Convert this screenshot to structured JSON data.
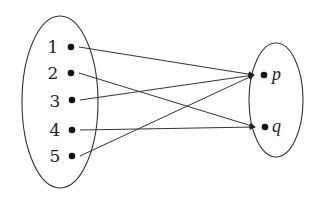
{
  "diagram": {
    "type": "mapping-diagram",
    "domain_set": {
      "elements": [
        {
          "label": "1",
          "x": 71,
          "y": 47
        },
        {
          "label": "2",
          "x": 71,
          "y": 73
        },
        {
          "label": "3",
          "x": 72,
          "y": 100
        },
        {
          "label": "4",
          "x": 72,
          "y": 130
        },
        {
          "label": "5",
          "x": 72,
          "y": 156
        }
      ]
    },
    "codomain_set": {
      "elements": [
        {
          "label": "p",
          "x": 264,
          "y": 75
        },
        {
          "label": "q",
          "x": 265,
          "y": 127
        }
      ]
    },
    "mappings": [
      {
        "from": "1",
        "to": "p"
      },
      {
        "from": "2",
        "to": "q"
      },
      {
        "from": "3",
        "to": "p"
      },
      {
        "from": "4",
        "to": "q"
      },
      {
        "from": "5",
        "to": "p"
      }
    ],
    "colors": {
      "stroke": "#333333",
      "dot": "#111111",
      "background": "#ffffff"
    }
  }
}
